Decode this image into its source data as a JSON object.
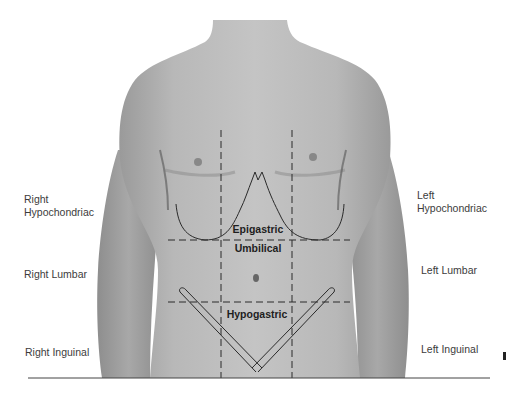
{
  "figure": {
    "labels": {
      "right_hypochondriac": "Right\nHypochondriac",
      "left_hypochondriac": "Left\nHypochondriac",
      "right_lumbar": "Right Lumbar",
      "left_lumbar": "Left Lumbar",
      "right_inguinal": "Right Inguinal",
      "left_inguinal": "Left Inguinal",
      "epigastric": "Epigastric",
      "umbilical": "Umbilical",
      "hypogastric": "Hypogastric"
    },
    "colors": {
      "skin": "#b4b4b4",
      "skin_shadow": "#8a8a8a",
      "guide_line": "#2a2a2a",
      "label_text": "#3c3c3c"
    }
  }
}
